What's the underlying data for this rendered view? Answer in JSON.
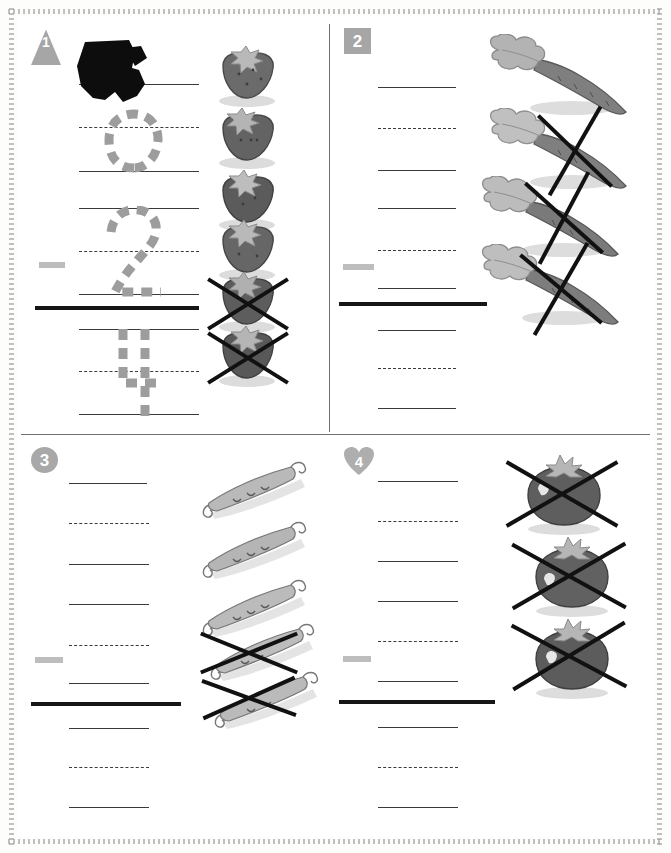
{
  "worksheet": {
    "title": "Subtraction picture worksheet",
    "paper_color": "#ffffff",
    "ink_color": "#3a3a3a",
    "guide_color": "#9d9d9d",
    "badge_color": "#a6a6a6",
    "cross_color": "#111111"
  },
  "problems": [
    {
      "number": "1",
      "badge_shape": "triangle",
      "item_name": "strawberry",
      "total": 6,
      "crossed_out": 2,
      "answer": 4,
      "minuend_label": "6",
      "subtrahend_label": "2",
      "operator": "minus",
      "trace_top": "6",
      "trace_middle": "2",
      "trace_bottom": "4",
      "student_mark": "heavy pencil scribble over top numeral"
    },
    {
      "number": "2",
      "badge_shape": "square",
      "item_name": "carrot",
      "total": 4,
      "crossed_out": 3,
      "answer": 1,
      "minuend_label": "4",
      "subtrahend_label": "3",
      "operator": "minus",
      "trace_top": "",
      "trace_middle": "",
      "trace_bottom": ""
    },
    {
      "number": "3",
      "badge_shape": "circle",
      "item_name": "pea pod",
      "total": 5,
      "crossed_out": 2,
      "answer": 3,
      "minuend_label": "5",
      "subtrahend_label": "2",
      "operator": "minus",
      "trace_top": "",
      "trace_middle": "",
      "trace_bottom": ""
    },
    {
      "number": "4",
      "badge_shape": "heart",
      "item_name": "tomato",
      "total": 3,
      "crossed_out": 3,
      "answer": 0,
      "minuend_label": "3",
      "subtrahend_label": "3",
      "operator": "minus",
      "trace_top": "",
      "trace_middle": "",
      "trace_bottom": ""
    }
  ]
}
